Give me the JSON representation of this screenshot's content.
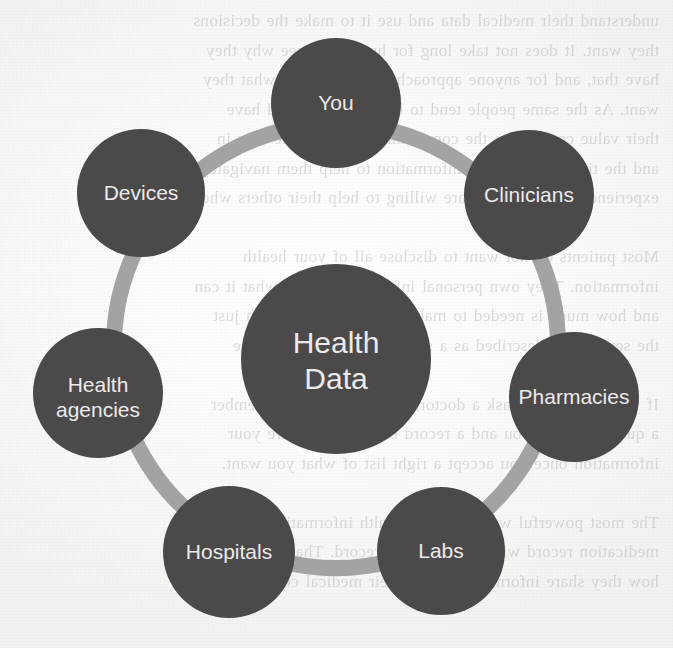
{
  "figure": {
    "type": "hub-and-spoke-ring-diagram",
    "hub": {
      "label_line1": "Health",
      "label_line2": "Data",
      "cx": 336,
      "cy": 359,
      "r": 95,
      "font_size": 30
    },
    "ring": {
      "cx": 336,
      "cy": 346,
      "r": 222,
      "stroke_width": 16,
      "color": "#a5a3a1"
    },
    "colors": {
      "node_fill": "#4b4a4a",
      "hub_fill": "#4b4a4a",
      "node_text": "#eceaea",
      "ring": "#a5a3a1",
      "paper": "#fdfcfb"
    },
    "nodes": [
      {
        "id": "you",
        "label": "You",
        "cx": 336,
        "cy": 103,
        "r": 65,
        "font_size": 21,
        "angle_deg": -90
      },
      {
        "id": "clinicians",
        "label": "Clinicians",
        "cx": 529,
        "cy": 195,
        "r": 65,
        "font_size": 21,
        "angle_deg": -25
      },
      {
        "id": "pharmacies",
        "label": "Pharmacies",
        "cx": 574,
        "cy": 397,
        "r": 65,
        "font_size": 21,
        "angle_deg": 13
      },
      {
        "id": "labs",
        "label": "Labs",
        "cx": 441,
        "cy": 551,
        "r": 64,
        "font_size": 21,
        "angle_deg": 64
      },
      {
        "id": "hospitals",
        "label": "Hospitals",
        "cx": 229,
        "cy": 552,
        "r": 66,
        "font_size": 21,
        "angle_deg": 117
      },
      {
        "id": "health-agencies",
        "label": "Health agencies",
        "label_line1": "Health",
        "label_line2": "agencies",
        "cx": 98,
        "cy": 393,
        "r": 65,
        "font_size": 21,
        "angle_deg": 167
      },
      {
        "id": "devices",
        "label": "Devices",
        "cx": 141,
        "cy": 193,
        "r": 64,
        "font_size": 21,
        "angle_deg": -155
      }
    ],
    "connectors": [
      {
        "from": "devices",
        "to": "you"
      },
      {
        "from": "you",
        "to": "clinicians"
      },
      {
        "from": "clinicians",
        "to": "pharmacies"
      },
      {
        "from": "pharmacies",
        "to": "labs"
      },
      {
        "from": "labs",
        "to": "hospitals"
      },
      {
        "from": "hospitals",
        "to": "health-agencies"
      },
      {
        "from": "health-agencies",
        "to": "devices"
      }
    ]
  },
  "background_bleed": {
    "lines": [
      "understand their medical data and use it to make the decisions",
      "they want. It does not take long for humans to see why they",
      "have that, and for anyone approaching them to get what they",
      "want. As the same people tend to be brought up and have",
      "their value come from the community. Consider the way in",
      "and the time to share this information to help them navigate",
      "experienced patients who are willing to help their others who ask.",
      "",
      "Most patients do not want to disclose all of your health",
      "information. They own personal information about what it can",
      "and how much is needed to make it easier to help with just",
      "the services as described as a self-advocate, with the one",
      "",
      "If you are going to ask a doctor, a nurse, or family member",
      "a question about you and a record or help you share your",
      "information once you accept a right list of what you want.",
      "",
      "The most powerful ways to share health information are your",
      "medication record with access to the record. That helps and",
      "how they share information about their medical conditions, for"
    ]
  }
}
